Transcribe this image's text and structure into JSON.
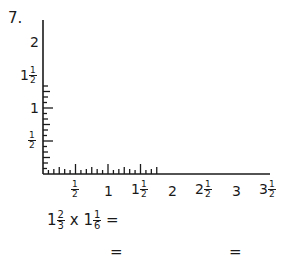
{
  "problem": {
    "number": "7.",
    "equation": {
      "whole1": "1",
      "num1": "2",
      "den1": "3",
      "op": "x",
      "whole2": "1",
      "num2": "1",
      "den2": "6",
      "equals": "="
    },
    "answer_line": {
      "eq1": "=",
      "eq2": "="
    }
  },
  "axes": {
    "y_labels": [
      {
        "whole": "2",
        "num": "",
        "den": ""
      },
      {
        "whole": "1",
        "num": "1",
        "den": "2"
      },
      {
        "whole": "1",
        "num": "",
        "den": ""
      },
      {
        "whole": "",
        "num": "1",
        "den": "2"
      }
    ],
    "x_labels": [
      {
        "whole": "",
        "num": "1",
        "den": "2"
      },
      {
        "whole": "1",
        "num": "",
        "den": ""
      },
      {
        "whole": "1",
        "num": "1",
        "den": "2"
      },
      {
        "whole": "2",
        "num": "",
        "den": ""
      },
      {
        "whole": "2",
        "num": "1",
        "den": "2"
      },
      {
        "whole": "3",
        "num": "",
        "den": ""
      },
      {
        "whole": "3",
        "num": "1",
        "den": "2"
      }
    ]
  },
  "chart_data": {
    "type": "grid-axes",
    "title": "",
    "x_range": [
      0,
      3.5
    ],
    "y_range": [
      0,
      2.6667
    ],
    "x_ticks_major": [
      "1/2",
      "1",
      "1 1/2",
      "2",
      "2 1/2",
      "3",
      "3 1/2"
    ],
    "y_ticks_major": [
      "1/2",
      "1",
      "1 1/2",
      "2"
    ],
    "minor_tick_interval": "1/6",
    "expression": "1 2/3 x 1 1/6 ="
  }
}
